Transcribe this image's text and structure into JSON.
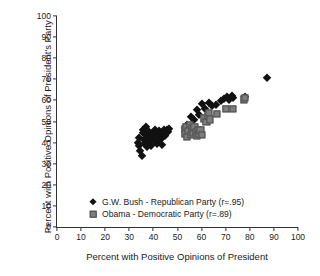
{
  "chart_data": {
    "type": "scatter",
    "title": "",
    "xlabel": "Percent with Positive Opinions of President",
    "ylabel": "Percent with Positive Opinions of President's Party",
    "xlim": [
      0,
      100
    ],
    "ylim": [
      0,
      100
    ],
    "xticks": [
      0,
      10,
      20,
      30,
      40,
      50,
      60,
      70,
      80,
      90,
      100
    ],
    "yticks": [
      0,
      10,
      20,
      30,
      40,
      50,
      60,
      70,
      80,
      90,
      100
    ],
    "grid": false,
    "legend_position": "lower-left-inside",
    "series": [
      {
        "name": "G.W. Bush - Republican Party (r=.95)",
        "label": "G.W. Bush - Republican Party",
        "correlation": ".95",
        "marker": "diamond",
        "color": "#111111",
        "points": [
          [
            33.5,
            40.0
          ],
          [
            34.0,
            38.5
          ],
          [
            34.2,
            42.0
          ],
          [
            34.6,
            36.0
          ],
          [
            35.2,
            33.8
          ],
          [
            35.5,
            46.0
          ],
          [
            35.8,
            44.5
          ],
          [
            36.2,
            41.0
          ],
          [
            36.5,
            39.2
          ],
          [
            36.8,
            43.5
          ],
          [
            37.0,
            47.5
          ],
          [
            37.4,
            37.8
          ],
          [
            37.8,
            41.5
          ],
          [
            38.0,
            45.0
          ],
          [
            38.3,
            40.2
          ],
          [
            38.6,
            43.0
          ],
          [
            39.0,
            38.6
          ],
          [
            39.4,
            42.2
          ],
          [
            39.8,
            44.0
          ],
          [
            40.2,
            40.8
          ],
          [
            40.6,
            46.2
          ],
          [
            41.0,
            42.8
          ],
          [
            41.5,
            39.5
          ],
          [
            42.0,
            43.8
          ],
          [
            42.4,
            45.5
          ],
          [
            42.8,
            41.2
          ],
          [
            43.2,
            44.6
          ],
          [
            43.6,
            38.9
          ],
          [
            44.0,
            42.5
          ],
          [
            44.5,
            45.8
          ],
          [
            45.0,
            43.2
          ],
          [
            45.5,
            46.0
          ],
          [
            46.0,
            45.2
          ],
          [
            46.4,
            46.5
          ],
          [
            53.0,
            47.0
          ],
          [
            53.5,
            45.5
          ],
          [
            54.0,
            48.5
          ],
          [
            55.5,
            52.0
          ],
          [
            57.0,
            50.5
          ],
          [
            58.0,
            55.5
          ],
          [
            59.0,
            53.0
          ],
          [
            60.0,
            58.5
          ],
          [
            61.5,
            56.0
          ],
          [
            62.5,
            52.5
          ],
          [
            63.0,
            59.0
          ],
          [
            64.5,
            57.5
          ],
          [
            66.0,
            58.0
          ],
          [
            68.0,
            59.5
          ],
          [
            69.5,
            60.5
          ],
          [
            70.5,
            61.5
          ],
          [
            71.5,
            60.0
          ],
          [
            72.5,
            62.0
          ],
          [
            73.0,
            61.0
          ],
          [
            78.0,
            61.5
          ],
          [
            87.0,
            70.5
          ]
        ]
      },
      {
        "name": "Obama - Democratic Party (r=.89)",
        "label": "Obama - Democratic Party",
        "correlation": ".89",
        "marker": "square",
        "color": "#7d7d7d",
        "points": [
          [
            53.0,
            46.5
          ],
          [
            53.2,
            44.0
          ],
          [
            53.5,
            47.5
          ],
          [
            54.0,
            42.8
          ],
          [
            54.5,
            45.5
          ],
          [
            55.0,
            48.5
          ],
          [
            55.5,
            43.5
          ],
          [
            56.0,
            46.8
          ],
          [
            56.5,
            44.8
          ],
          [
            57.0,
            47.2
          ],
          [
            57.5,
            45.0
          ],
          [
            58.0,
            43.0
          ],
          [
            58.5,
            46.0
          ],
          [
            59.0,
            44.2
          ],
          [
            59.5,
            45.8
          ],
          [
            60.0,
            43.6
          ],
          [
            61.0,
            51.5
          ],
          [
            62.0,
            50.0
          ],
          [
            62.5,
            52.5
          ],
          [
            63.0,
            54.0
          ],
          [
            63.5,
            51.0
          ],
          [
            66.5,
            53.5
          ],
          [
            70.0,
            56.0
          ],
          [
            73.0,
            56.0
          ],
          [
            77.5,
            60.5
          ],
          [
            78.0,
            61.0
          ]
        ]
      }
    ]
  }
}
